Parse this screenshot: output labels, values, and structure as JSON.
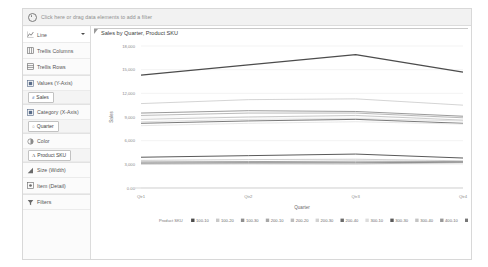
{
  "filter_bar": {
    "icon": "gear-icon",
    "hint": "Click here or drag data elements to add a filter"
  },
  "sidebar": {
    "chart_type": {
      "icon": "line-chart-icon",
      "label": "Line",
      "caret": "chevron-down-icon"
    },
    "shelves": [
      {
        "icon": "trellis-columns-icon",
        "label": "Trellis Columns"
      },
      {
        "icon": "trellis-rows-icon",
        "label": "Trellis Rows"
      },
      {
        "icon": "values-icon",
        "label": "Values (Y-Axis)"
      },
      {
        "icon": "category-icon",
        "label": "Category (X-Axis)"
      },
      {
        "icon": "color-icon",
        "label": "Color"
      },
      {
        "icon": "size-icon",
        "label": "Size (Width)"
      },
      {
        "icon": "item-icon",
        "label": "Item (Detail)"
      },
      {
        "icon": "filter-icon",
        "label": "Filters"
      }
    ],
    "pills": {
      "values": {
        "type_glyph": "#",
        "label": "Sales"
      },
      "category": {
        "type_glyph": "○",
        "label": "Quarter"
      },
      "color": {
        "type_glyph": "A",
        "label": "Product SKU"
      }
    }
  },
  "chart_data": {
    "type": "line",
    "title": "Sales by Quarter, Product SKU",
    "xlabel": "Quarter",
    "ylabel": "Sales",
    "categories": [
      "Qtr1",
      "Qtr2",
      "Qtr3",
      "Qtr4"
    ],
    "ylim": [
      0,
      18000
    ],
    "yticks": [
      0,
      3000,
      6000,
      9000,
      12000,
      15000,
      18000
    ],
    "ytick_labels": [
      "0.00",
      "3,000",
      "6,000",
      "9,000",
      "12,000",
      "15,000",
      "18,000"
    ],
    "grid": true,
    "legend_position": "bottom",
    "legend_title": "Product SKU",
    "series": [
      {
        "name": "100-10",
        "color": "#4c4c4c",
        "width": 1.3,
        "values": [
          14300,
          15600,
          16900,
          14700
        ]
      },
      {
        "name": "100-20",
        "color": "#c9c9c9",
        "width": 0.8,
        "values": [
          10700,
          11200,
          11300,
          10500
        ]
      },
      {
        "name": "100-30",
        "color": "#8f8f8f",
        "width": 0.9,
        "values": [
          9500,
          9800,
          9700,
          9100
        ]
      },
      {
        "name": "200-10",
        "color": "#a8a8a8",
        "width": 0.8,
        "values": [
          9200,
          9500,
          9500,
          8900
        ]
      },
      {
        "name": "200-20",
        "color": "#bdbdbd",
        "width": 0.8,
        "values": [
          8700,
          9000,
          9200,
          8600
        ]
      },
      {
        "name": "200-30",
        "color": "#d2d2d2",
        "width": 0.7,
        "values": [
          8400,
          8700,
          8800,
          8500
        ]
      },
      {
        "name": "200-40",
        "color": "#6b6b6b",
        "width": 0.9,
        "values": [
          8200,
          8500,
          8700,
          8200
        ]
      },
      {
        "name": "300-10",
        "color": "#dcdcdc",
        "width": 0.7,
        "values": [
          7900,
          8200,
          8400,
          8100
        ]
      },
      {
        "name": "300-30",
        "color": "#5a5a5a",
        "width": 1.0,
        "values": [
          3900,
          4100,
          4300,
          3800
        ]
      },
      {
        "name": "300-40",
        "color": "#c4c4c4",
        "width": 0.8,
        "values": [
          3500,
          3600,
          3650,
          3450
        ]
      },
      {
        "name": "400-10",
        "color": "#989898",
        "width": 0.9,
        "values": [
          3300,
          3350,
          3400,
          3350
        ]
      },
      {
        "name": "400-20",
        "color": "#777777",
        "width": 0.9,
        "values": [
          3150,
          3200,
          3200,
          3250
        ]
      },
      {
        "name": "400-30",
        "color": "#aeaeae",
        "width": 0.8,
        "values": [
          3050,
          3080,
          3060,
          3200
        ]
      }
    ]
  }
}
